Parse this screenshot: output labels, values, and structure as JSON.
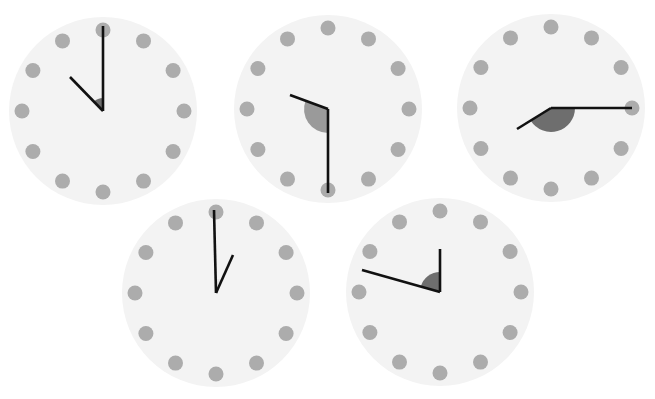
{
  "figure": {
    "width": 655,
    "height": 399,
    "background": "#ffffff",
    "face_color": "#f3f3f3",
    "dot_color": "#acacac",
    "hand_color": "#111111"
  },
  "clocks": [
    {
      "id": "clock-1",
      "center": [
        103,
        111
      ],
      "radius": 94,
      "dot_ring": 81,
      "dot_radius": 7.5,
      "minute_hand_end": [
        103,
        26
      ],
      "hour_hand_end": [
        70,
        77
      ],
      "angle_shade": {
        "radius": 13,
        "color": "#6e6e6e",
        "from_end": "hour",
        "to_end": "minute"
      }
    },
    {
      "id": "clock-2",
      "center": [
        328,
        109
      ],
      "radius": 94,
      "dot_ring": 81,
      "dot_radius": 7.5,
      "minute_hand_end": [
        328,
        193
      ],
      "hour_hand_end": [
        290,
        95
      ],
      "angle_shade": {
        "radius": 24,
        "color": "#9a9a9a",
        "from_end": "minute",
        "to_end": "hour"
      }
    },
    {
      "id": "clock-3",
      "center": [
        551,
        108
      ],
      "radius": 94,
      "dot_ring": 81,
      "dot_radius": 7.5,
      "minute_hand_end": [
        632,
        108
      ],
      "hour_hand_end": [
        517,
        129
      ],
      "angle_shade": {
        "radius": 24,
        "color": "#6e6e6e",
        "from_end": "minute",
        "to_end": "hour"
      }
    },
    {
      "id": "clock-4",
      "center": [
        216,
        293
      ],
      "radius": 94,
      "dot_ring": 81,
      "dot_radius": 7.5,
      "minute_hand_end": [
        214,
        210
      ],
      "hour_hand_end": [
        233,
        255
      ],
      "angle_shade": {
        "radius": 14,
        "color": "#e6e6e6",
        "from_end": "minute",
        "to_end": "hour"
      }
    },
    {
      "id": "clock-5",
      "center": [
        440,
        292
      ],
      "radius": 94,
      "dot_ring": 81,
      "dot_radius": 7.5,
      "minute_hand_end": [
        362,
        270
      ],
      "hour_hand_end": [
        440,
        249
      ],
      "angle_shade": {
        "radius": 20,
        "color": "#6e6e6e",
        "from_end": "minute",
        "to_end": "hour"
      }
    }
  ]
}
